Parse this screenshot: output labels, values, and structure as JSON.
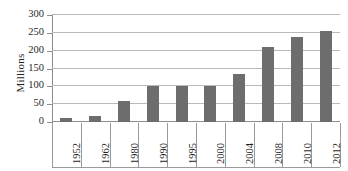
{
  "chart_data": {
    "type": "bar",
    "title": "",
    "xlabel": "",
    "ylabel": "Millions",
    "categories": [
      "1952",
      "1962",
      "1980",
      "1990",
      "1995",
      "2000",
      "2004",
      "2008",
      "2010",
      "2012"
    ],
    "values": [
      10,
      16,
      60,
      100,
      102,
      102,
      136,
      210,
      238,
      256
    ],
    "ylim": [
      0,
      300
    ],
    "ytick_labels": [
      "300",
      "250",
      "200",
      "150",
      "100",
      "50",
      "0"
    ],
    "ytick_values": [
      300,
      250,
      200,
      150,
      100,
      50,
      0
    ],
    "grid": true,
    "legend": "none",
    "series_color": "#6d6d6d",
    "gridline_color": "#b9b9b9",
    "axis_color": "#8e8e8e",
    "background": "#ffffff"
  }
}
